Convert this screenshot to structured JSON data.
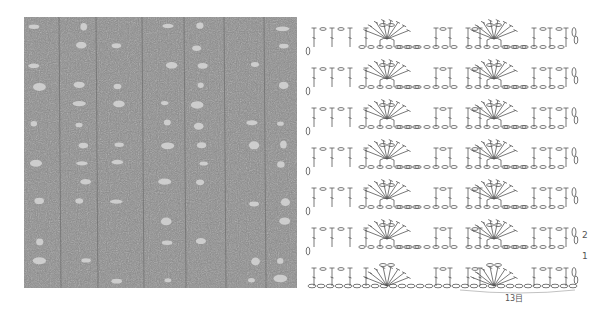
{
  "photo": {
    "description": "crocheted swatch photo, grey yarn, fan and open mesh pattern",
    "base_color": "#8a8a8a",
    "hole_color": "#d8d8d8"
  },
  "chart": {
    "line_color": "#555555",
    "row_labels": [
      {
        "label": "2",
        "x": 282,
        "y": 240
      },
      {
        "label": "1",
        "x": 282,
        "y": 260
      }
    ],
    "repeat_label": "13目",
    "rows": 8,
    "fans_per_row": 2,
    "fan_centers_x": [
      87,
      194
    ],
    "dc_columns_x": [
      14,
      32,
      50,
      66,
      136,
      150,
      168,
      180,
      234,
      250,
      266
    ],
    "chain_stitches_in_foundation": 30
  }
}
